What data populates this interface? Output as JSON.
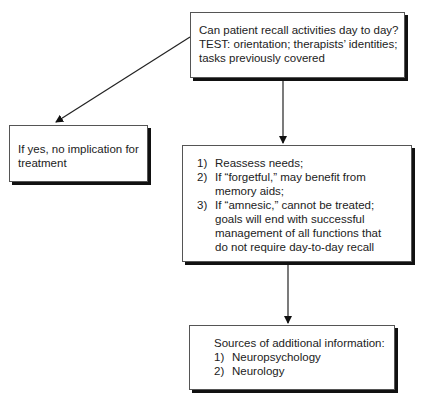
{
  "nodes": {
    "question": {
      "lines": [
        "Can patient recall activities day to day?",
        "TEST: orientation; therapists’ identities;",
        "tasks previously covered"
      ]
    },
    "yes_branch": {
      "lines": [
        "If yes, no implication for",
        "treatment"
      ]
    },
    "actions": {
      "items": [
        {
          "num": "1)",
          "text": "Reassess needs;"
        },
        {
          "num": "2)",
          "text": "If “forgetful,” may benefit from memory aids;"
        },
        {
          "num": "3)",
          "text": "If “amnesic,” cannot be treated; goals will end with successful management of all functions that do not require day-to-day recall"
        }
      ]
    },
    "sources": {
      "heading": "Sources of additional information:",
      "items": [
        {
          "num": "1)",
          "text": "Neuropsychology"
        },
        {
          "num": "2)",
          "text": "Neurology"
        }
      ]
    }
  },
  "edges": [
    {
      "from": "question",
      "to": "yes_branch"
    },
    {
      "from": "question",
      "to": "actions"
    },
    {
      "from": "actions",
      "to": "sources"
    }
  ]
}
